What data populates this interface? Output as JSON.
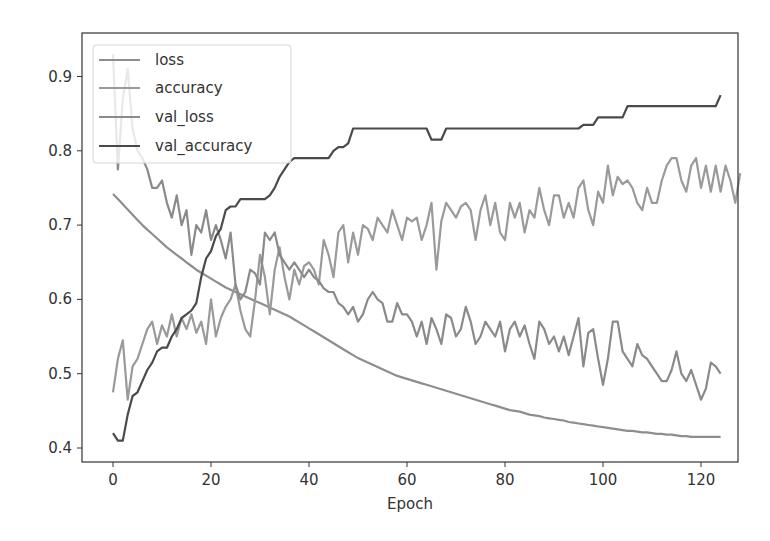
{
  "chart_data": {
    "type": "line",
    "title": "",
    "xlabel": "Epoch",
    "ylabel": "",
    "xlim": [
      -6,
      130
    ],
    "ylim": [
      0.39,
      0.945
    ],
    "xticks": [
      0,
      20,
      40,
      60,
      80,
      100,
      120
    ],
    "yticks": [
      0.4,
      0.5,
      0.6,
      0.7,
      0.8,
      0.9
    ],
    "ytick_labels": [
      "0.4",
      "0.5",
      "0.6",
      "0.7",
      "0.8",
      "0.9"
    ],
    "xtick_labels": [
      "0",
      "20",
      "40",
      "60",
      "80",
      "100",
      "120"
    ],
    "grid": false,
    "legend_position": "upper left",
    "series": [
      {
        "name": "loss",
        "color": "#8e8e8e",
        "values": [
          0.742,
          0.735,
          0.728,
          0.721,
          0.714,
          0.707,
          0.7,
          0.694,
          0.688,
          0.682,
          0.676,
          0.67,
          0.665,
          0.66,
          0.655,
          0.65,
          0.645,
          0.64,
          0.636,
          0.632,
          0.628,
          0.624,
          0.62,
          0.616,
          0.613,
          0.61,
          0.607,
          0.604,
          0.601,
          0.598,
          0.595,
          0.592,
          0.589,
          0.586,
          0.583,
          0.58,
          0.577,
          0.573,
          0.569,
          0.565,
          0.561,
          0.557,
          0.553,
          0.549,
          0.545,
          0.541,
          0.537,
          0.533,
          0.529,
          0.525,
          0.521,
          0.518,
          0.515,
          0.512,
          0.509,
          0.506,
          0.503,
          0.5,
          0.497,
          0.495,
          0.493,
          0.491,
          0.489,
          0.487,
          0.485,
          0.483,
          0.481,
          0.479,
          0.477,
          0.475,
          0.473,
          0.471,
          0.469,
          0.467,
          0.465,
          0.463,
          0.461,
          0.459,
          0.457,
          0.455,
          0.453,
          0.451,
          0.45,
          0.449,
          0.447,
          0.445,
          0.444,
          0.443,
          0.441,
          0.44,
          0.439,
          0.438,
          0.437,
          0.435,
          0.434,
          0.433,
          0.432,
          0.431,
          0.43,
          0.429,
          0.428,
          0.427,
          0.426,
          0.425,
          0.424,
          0.423,
          0.423,
          0.422,
          0.421,
          0.421,
          0.42,
          0.419,
          0.419,
          0.418,
          0.418,
          0.417,
          0.416,
          0.416,
          0.415,
          0.415,
          0.415,
          0.415,
          0.415,
          0.415,
          0.415
        ]
      },
      {
        "name": "accuracy",
        "color": "#9a9a9a",
        "values": [
          0.475,
          0.52,
          0.545,
          0.465,
          0.51,
          0.52,
          0.54,
          0.56,
          0.57,
          0.54,
          0.565,
          0.55,
          0.58,
          0.55,
          0.575,
          0.56,
          0.58,
          0.555,
          0.57,
          0.54,
          0.6,
          0.55,
          0.575,
          0.59,
          0.6,
          0.62,
          0.585,
          0.56,
          0.55,
          0.6,
          0.66,
          0.63,
          0.58,
          0.64,
          0.67,
          0.63,
          0.6,
          0.64,
          0.62,
          0.645,
          0.65,
          0.64,
          0.62,
          0.68,
          0.66,
          0.63,
          0.69,
          0.7,
          0.65,
          0.69,
          0.66,
          0.7,
          0.695,
          0.68,
          0.71,
          0.7,
          0.69,
          0.72,
          0.7,
          0.68,
          0.71,
          0.705,
          0.71,
          0.68,
          0.7,
          0.73,
          0.64,
          0.705,
          0.73,
          0.72,
          0.71,
          0.725,
          0.73,
          0.72,
          0.68,
          0.72,
          0.74,
          0.7,
          0.73,
          0.69,
          0.68,
          0.73,
          0.71,
          0.73,
          0.69,
          0.72,
          0.71,
          0.75,
          0.72,
          0.7,
          0.74,
          0.74,
          0.71,
          0.73,
          0.71,
          0.75,
          0.76,
          0.72,
          0.7,
          0.745,
          0.73,
          0.78,
          0.74,
          0.765,
          0.755,
          0.76,
          0.75,
          0.73,
          0.72,
          0.75,
          0.73,
          0.73,
          0.76,
          0.78,
          0.79,
          0.79,
          0.76,
          0.745,
          0.78,
          0.79,
          0.75,
          0.78,
          0.745,
          0.78,
          0.745,
          0.78,
          0.76,
          0.73,
          0.77
        ]
      },
      {
        "name": "val_loss",
        "color": "#8a8a8a",
        "values": [
          0.93,
          0.775,
          0.87,
          0.91,
          0.83,
          0.8,
          0.79,
          0.775,
          0.75,
          0.75,
          0.76,
          0.73,
          0.71,
          0.74,
          0.7,
          0.72,
          0.66,
          0.7,
          0.69,
          0.72,
          0.68,
          0.7,
          0.68,
          0.655,
          0.69,
          0.62,
          0.6,
          0.61,
          0.64,
          0.635,
          0.62,
          0.69,
          0.68,
          0.69,
          0.66,
          0.65,
          0.64,
          0.65,
          0.64,
          0.63,
          0.64,
          0.63,
          0.625,
          0.615,
          0.61,
          0.61,
          0.595,
          0.59,
          0.58,
          0.59,
          0.57,
          0.58,
          0.6,
          0.61,
          0.6,
          0.595,
          0.57,
          0.57,
          0.595,
          0.58,
          0.58,
          0.57,
          0.55,
          0.57,
          0.54,
          0.575,
          0.56,
          0.54,
          0.58,
          0.575,
          0.55,
          0.56,
          0.59,
          0.57,
          0.54,
          0.55,
          0.57,
          0.56,
          0.55,
          0.57,
          0.53,
          0.56,
          0.57,
          0.55,
          0.565,
          0.54,
          0.52,
          0.57,
          0.56,
          0.54,
          0.55,
          0.53,
          0.55,
          0.525,
          0.55,
          0.575,
          0.51,
          0.555,
          0.56,
          0.52,
          0.485,
          0.52,
          0.57,
          0.57,
          0.53,
          0.52,
          0.51,
          0.54,
          0.525,
          0.52,
          0.51,
          0.5,
          0.49,
          0.49,
          0.505,
          0.53,
          0.5,
          0.49,
          0.505,
          0.485,
          0.465,
          0.48,
          0.515,
          0.51,
          0.5
        ]
      },
      {
        "name": "val_accuracy",
        "color": "#4a4a4a",
        "values": [
          0.42,
          0.41,
          0.41,
          0.445,
          0.47,
          0.475,
          0.49,
          0.505,
          0.515,
          0.53,
          0.535,
          0.535,
          0.55,
          0.56,
          0.575,
          0.58,
          0.585,
          0.595,
          0.63,
          0.655,
          0.665,
          0.685,
          0.695,
          0.72,
          0.725,
          0.725,
          0.735,
          0.735,
          0.735,
          0.735,
          0.735,
          0.735,
          0.74,
          0.75,
          0.765,
          0.775,
          0.785,
          0.79,
          0.79,
          0.79,
          0.79,
          0.79,
          0.79,
          0.79,
          0.79,
          0.8,
          0.805,
          0.805,
          0.81,
          0.83,
          0.83,
          0.83,
          0.83,
          0.83,
          0.83,
          0.83,
          0.83,
          0.83,
          0.83,
          0.83,
          0.83,
          0.83,
          0.83,
          0.83,
          0.83,
          0.815,
          0.815,
          0.815,
          0.83,
          0.83,
          0.83,
          0.83,
          0.83,
          0.83,
          0.83,
          0.83,
          0.83,
          0.83,
          0.83,
          0.83,
          0.83,
          0.83,
          0.83,
          0.83,
          0.83,
          0.83,
          0.83,
          0.83,
          0.83,
          0.83,
          0.83,
          0.83,
          0.83,
          0.83,
          0.83,
          0.83,
          0.835,
          0.835,
          0.835,
          0.845,
          0.845,
          0.845,
          0.845,
          0.845,
          0.845,
          0.86,
          0.86,
          0.86,
          0.86,
          0.86,
          0.86,
          0.86,
          0.86,
          0.86,
          0.86,
          0.86,
          0.86,
          0.86,
          0.86,
          0.86,
          0.86,
          0.86,
          0.86,
          0.86,
          0.875
        ]
      }
    ]
  }
}
